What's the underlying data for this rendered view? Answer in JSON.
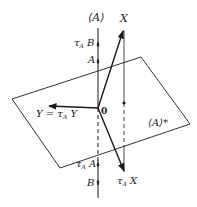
{
  "diagram": {
    "labels": {
      "subspace_A": "⟨A⟩",
      "vector_X": "X",
      "tau_B": "τ",
      "tau_B_sub": "A",
      "tau_B_var": " B",
      "point_A": "A",
      "origin": "0",
      "Y_eq": "Y = τ",
      "Y_eq_sub": "A",
      "Y_eq_var": " Y",
      "orth_complement": "⟨A⟩*",
      "tau_A_prime": "τ",
      "tau_A_prime_sub": "A",
      "tau_A_prime_var": " A'",
      "point_B": "B",
      "tau_X": "τ",
      "tau_X_sub": "A",
      "tau_X_var": " X"
    },
    "colors": {
      "line": "#1a1a1a",
      "background": "#ffffff"
    }
  }
}
